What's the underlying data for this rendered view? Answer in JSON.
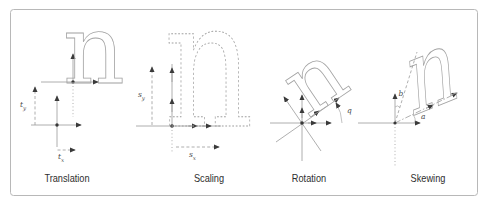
{
  "figure": {
    "type": "diagram-2d-transformations",
    "background_color": "#ffffff",
    "border_color": "#b8b8b8",
    "line_color": "#9b9b9b",
    "arrow_color": "#3a3a3a",
    "glyph_outline_color": "#a3a3a3",
    "caption_color": "#2e2e2e"
  },
  "panels": {
    "translation": {
      "caption": "Translation",
      "glyph": "n",
      "label_ty": {
        "base": "t",
        "sub": "y"
      },
      "label_tx": {
        "base": "t",
        "sub": "x"
      }
    },
    "scaling": {
      "caption": "Scaling",
      "glyph": "n",
      "label_sy": {
        "base": "s",
        "sub": "y"
      },
      "label_sx": {
        "base": "s",
        "sub": "x"
      }
    },
    "rotation": {
      "caption": "Rotation",
      "glyph": "n",
      "label_angle": "q"
    },
    "skewing": {
      "caption": "Skewing",
      "glyph": "n",
      "label_b": "b",
      "label_a": "a"
    }
  }
}
